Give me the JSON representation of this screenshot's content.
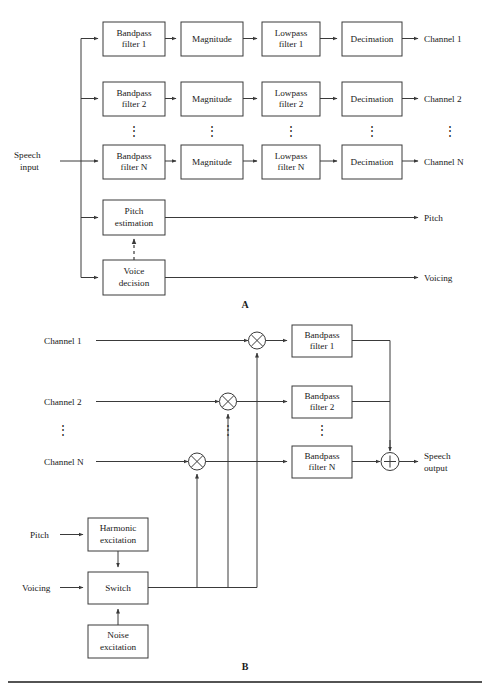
{
  "figure": {
    "panels": [
      {
        "id": "A",
        "label": "A",
        "caption": "Analysis (channel vocoder analyzer)"
      },
      {
        "id": "B",
        "label": "B",
        "caption": "Synthesis (channel vocoder synthesizer)"
      }
    ],
    "ellipsis": "⋮"
  },
  "analysis": {
    "input_label_line1": "Speech",
    "input_label_line2": "input",
    "rows": [
      {
        "bandpass_line1": "Bandpass",
        "bandpass_line2": "filter 1",
        "magnitude": "Magnitude",
        "lowpass_line1": "Lowpass",
        "lowpass_line2": "filter 1",
        "decimation": "Decimation",
        "output": "Channel 1"
      },
      {
        "bandpass_line1": "Bandpass",
        "bandpass_line2": "filter 2",
        "magnitude": "Magnitude",
        "lowpass_line1": "Lowpass",
        "lowpass_line2": "filter 2",
        "decimation": "Decimation",
        "output": "Channel 2"
      },
      {
        "bandpass_line1": "Bandpass",
        "bandpass_line2": "filter N",
        "magnitude": "Magnitude",
        "lowpass_line1": "Lowpass",
        "lowpass_line2": "filter N",
        "decimation": "Decimation",
        "output": "Channel N"
      }
    ],
    "pitch_block_line1": "Pitch",
    "pitch_block_line2": "estimation",
    "pitch_output": "Pitch",
    "voice_block_line1": "Voice",
    "voice_block_line2": "decision",
    "voicing_output": "Voicing"
  },
  "synthesis": {
    "rows": [
      {
        "input": "Channel 1",
        "bandpass_line1": "Bandpass",
        "bandpass_line2": "filter 1"
      },
      {
        "input": "Channel 2",
        "bandpass_line1": "Bandpass",
        "bandpass_line2": "filter 2"
      },
      {
        "input": "Channel N",
        "bandpass_line1": "Bandpass",
        "bandpass_line2": "filter N"
      }
    ],
    "multiply_symbol": "×",
    "sum_symbol": "+",
    "output_line1": "Speech",
    "output_line2": "output",
    "pitch_input": "Pitch",
    "voicing_input": "Voicing",
    "harmonic_line1": "Harmonic",
    "harmonic_line2": "excitation",
    "switch": "Switch",
    "noise_line1": "Noise",
    "noise_line2": "excitation"
  },
  "colors": {
    "stroke": "#3a3a3a",
    "text": "#1a1a1a",
    "background": "#ffffff",
    "rule": "#1a1a1a"
  }
}
